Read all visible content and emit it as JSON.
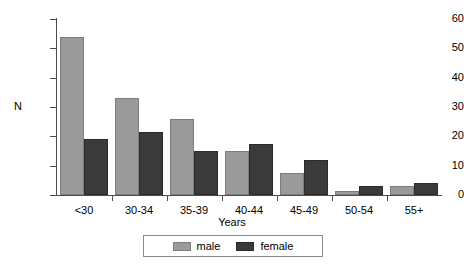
{
  "chart_data": {
    "type": "bar",
    "title": "",
    "xlabel": "Years",
    "ylabel": "N",
    "categories": [
      "<30",
      "30-34",
      "35-39",
      "40-44",
      "45-49",
      "50-54",
      "55+"
    ],
    "series": [
      {
        "name": "male",
        "color": "#9a9a9a",
        "values": [
          54,
          33,
          26,
          15,
          7.5,
          1.5,
          3
        ]
      },
      {
        "name": "female",
        "color": "#3a3a3a",
        "values": [
          19,
          21.5,
          15,
          17.5,
          12,
          3,
          4
        ]
      }
    ],
    "ylim": [
      0,
      60
    ],
    "yticks": [
      0,
      10,
      20,
      30,
      40,
      50,
      60
    ],
    "ytick_labels": [
      "0",
      "10",
      "20",
      "30",
      "40",
      "50",
      "60"
    ],
    "grid": false,
    "legend": {
      "position": "bottom-center",
      "entries": [
        {
          "label": "male",
          "color": "#9a9a9a"
        },
        {
          "label": "female",
          "color": "#3a3a3a"
        }
      ]
    }
  }
}
